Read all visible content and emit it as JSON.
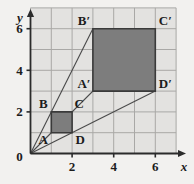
{
  "figure": {
    "type": "dilation-diagram",
    "background_color": "#f2f1ef",
    "grid_background_color": "#e3e2e0",
    "grid_line_color": "#a9a8a6",
    "axis_color": "#2b2b2b",
    "shape_fill_color": "#7d7d7d",
    "shape_stroke_color": "#3a3a3a",
    "ray_color": "#4a4a4a",
    "axis_labels": {
      "x": "x",
      "y": "y",
      "origin": "0"
    },
    "x_ticks": [
      "2",
      "4",
      "6"
    ],
    "x_tick_values": [
      2,
      4,
      6
    ],
    "y_ticks": [
      "2",
      "4",
      "6"
    ],
    "y_tick_values": [
      2,
      4,
      6
    ],
    "x_range": [
      0,
      7
    ],
    "y_range": [
      0,
      7
    ],
    "grid_spacing": 1,
    "point_labels": {
      "A": "A",
      "B": "B",
      "C": "C",
      "D": "D",
      "Ap": "A′",
      "Bp": "B′",
      "Cp": "C′",
      "Dp": "D′"
    },
    "preimage": {
      "name": "ABCD",
      "vertices": [
        {
          "label": "A",
          "x": 1,
          "y": 1
        },
        {
          "label": "B",
          "x": 1,
          "y": 2
        },
        {
          "label": "C",
          "x": 2,
          "y": 2
        },
        {
          "label": "D",
          "x": 2,
          "y": 1
        }
      ]
    },
    "image": {
      "name": "A′B′C′D′",
      "vertices": [
        {
          "label": "A′",
          "x": 3,
          "y": 3
        },
        {
          "label": "B′",
          "x": 3,
          "y": 6
        },
        {
          "label": "C′",
          "x": 6,
          "y": 6
        },
        {
          "label": "D′",
          "x": 6,
          "y": 3
        }
      ]
    },
    "rays": [
      {
        "name": "ray-origin-B-Bprime",
        "x1": 0,
        "y1": 0,
        "x2": 3,
        "y2": 6
      },
      {
        "name": "ray-origin-C-Cprime",
        "x1": 0,
        "y1": 0,
        "x2": 6,
        "y2": 6
      },
      {
        "name": "ray-origin-D-Dprime",
        "x1": 0,
        "y1": 0,
        "x2": 6,
        "y2": 3
      }
    ]
  }
}
